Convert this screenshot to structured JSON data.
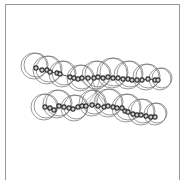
{
  "figure": {
    "colors": {
      "frame": "#9a9a9a",
      "sphere": "#6e6e6e",
      "atom": "#3a3a3a",
      "bond": "#555555"
    },
    "upper_chain": {
      "spheres": [
        [
          34,
          66,
          13
        ],
        [
          47,
          70,
          14
        ],
        [
          62,
          74,
          13
        ],
        [
          80,
          78,
          13
        ],
        [
          96,
          75,
          14
        ],
        [
          112,
          73,
          15
        ],
        [
          128,
          75,
          14
        ],
        [
          146,
          77,
          13
        ],
        [
          160,
          79,
          11
        ]
      ],
      "atoms": [
        [
          36,
          68
        ],
        [
          42,
          70
        ],
        [
          47,
          70
        ],
        [
          50,
          72
        ],
        [
          57,
          73
        ],
        [
          60,
          74
        ],
        [
          70,
          77
        ],
        [
          74,
          78
        ],
        [
          78,
          79
        ],
        [
          82,
          78
        ],
        [
          88,
          78
        ],
        [
          94,
          78
        ],
        [
          98,
          77
        ],
        [
          103,
          78
        ],
        [
          108,
          77
        ],
        [
          113,
          78
        ],
        [
          118,
          78
        ],
        [
          123,
          79
        ],
        [
          128,
          79
        ],
        [
          132,
          80
        ],
        [
          137,
          80
        ],
        [
          142,
          80
        ],
        [
          148,
          79
        ],
        [
          155,
          80
        ],
        [
          158,
          80
        ]
      ]
    },
    "lower_chain": {
      "spheres": [
        [
          44,
          107,
          13
        ],
        [
          57,
          104,
          14
        ],
        [
          74,
          108,
          13
        ],
        [
          92,
          103,
          13
        ],
        [
          108,
          103,
          14
        ],
        [
          126,
          108,
          14
        ],
        [
          141,
          112,
          13
        ],
        [
          155,
          114,
          11
        ]
      ],
      "atoms": [
        [
          45,
          107
        ],
        [
          50,
          108
        ],
        [
          54,
          110
        ],
        [
          59,
          106
        ],
        [
          64,
          107
        ],
        [
          69,
          108
        ],
        [
          73,
          109
        ],
        [
          78,
          107
        ],
        [
          82,
          106
        ],
        [
          86,
          106
        ],
        [
          92,
          105
        ],
        [
          98,
          106
        ],
        [
          104,
          107
        ],
        [
          108,
          106
        ],
        [
          113,
          107
        ],
        [
          117,
          108
        ],
        [
          122,
          108
        ],
        [
          125,
          111
        ],
        [
          128,
          112
        ],
        [
          133,
          114
        ],
        [
          137,
          115
        ],
        [
          141,
          115
        ],
        [
          146,
          116
        ],
        [
          151,
          117
        ],
        [
          155,
          117
        ]
      ]
    },
    "bridge_center": [
      96,
      92
    ]
  }
}
